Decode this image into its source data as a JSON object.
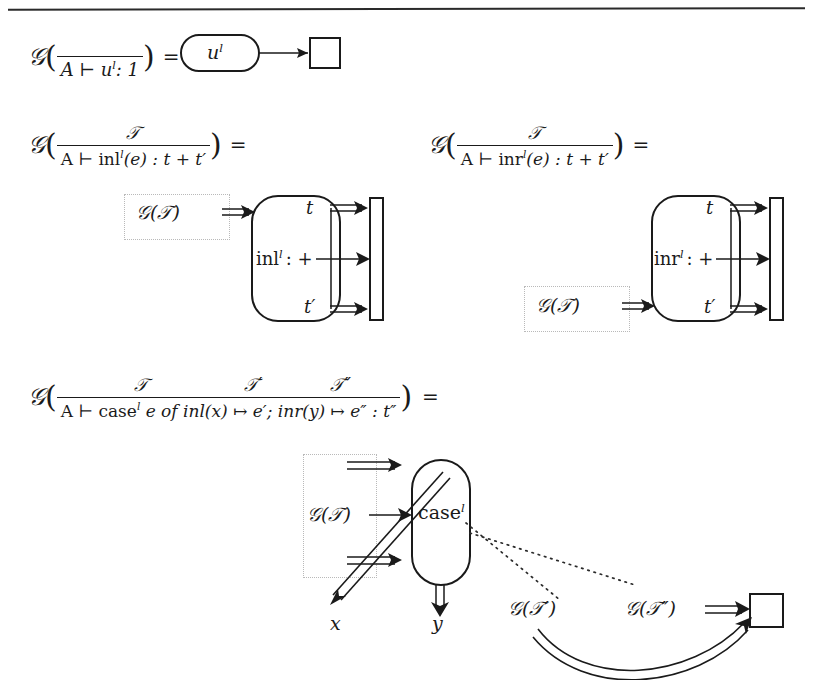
{
  "page": {
    "width": 813,
    "height": 680,
    "background": "#ffffff",
    "ink": "#1a1a1a",
    "ghost_border": "#b9b9b9",
    "has_top_rule": true
  },
  "equations": [
    {
      "id": "unit",
      "lhs": {
        "functor": "G",
        "open_paren": "(",
        "rule": {
          "numerator": "",
          "denominator_parts": [
            "A",
            "⊢",
            "u",
            "l",
            ":",
            "1"
          ],
          "denominator_text": "A ⊢ uˡ : 1"
        },
        "close_paren": ")"
      },
      "equals": "=",
      "diagram": {
        "node_label": "u",
        "node_superscript": "l",
        "node_shape": "stadium",
        "target_shape": "square",
        "arrow_style": "single"
      }
    },
    {
      "id": "inl",
      "lhs": {
        "functor": "G",
        "open_paren": "(",
        "rule": {
          "numerator": "T",
          "denominator_text": "A ⊢ inlˡ(e) : t + t′"
        },
        "close_paren": ")"
      },
      "equals": "=",
      "diagram": {
        "input_label": "G(T)",
        "input_position": "top",
        "box_label": "inl",
        "box_superscript": "l",
        "box_operator": ": +",
        "out_top": "t",
        "out_bottom": "t′",
        "bar": "tensor-bar",
        "arrows": [
          "double",
          "single",
          "double"
        ]
      }
    },
    {
      "id": "inr",
      "lhs": {
        "functor": "G",
        "open_paren": "(",
        "rule": {
          "numerator": "T",
          "denominator_text": "A ⊢ inrˡ(e) : t + t′"
        },
        "close_paren": ")"
      },
      "equals": "=",
      "diagram": {
        "input_label": "G(T)",
        "input_position": "bottom",
        "box_label": "inr",
        "box_superscript": "l",
        "box_operator": ": +",
        "out_top": "t",
        "out_bottom": "t′",
        "bar": "tensor-bar",
        "arrows": [
          "double",
          "single",
          "double"
        ]
      }
    },
    {
      "id": "case",
      "lhs": {
        "functor": "G",
        "open_paren": "(",
        "rule": {
          "numerators": [
            "T",
            "T′",
            "T″"
          ],
          "denominator_text": "A ⊢ caseˡ e of inl(x) ↦ e′; inr(y) ↦ e″ : t″"
        },
        "close_paren": ")"
      },
      "equals": "=",
      "diagram": {
        "input_label": "G(T)",
        "box_label": "case",
        "box_superscript": "l",
        "out_left": "x",
        "out_right": "y",
        "aux_labels": [
          "G(T′)",
          "G(T″)"
        ],
        "target_shape": "square",
        "dotted_connectors": 2,
        "curved_arrow": "double"
      }
    }
  ],
  "symbols": {
    "functor": "𝒢",
    "turnstile": "⊢",
    "mapsto": "↦",
    "plus": "+",
    "equals": "=",
    "colon": ":",
    "semicolon": ";",
    "prime": "′",
    "dprime": "″",
    "script_T": "𝒯",
    "of_keyword": "of",
    "one": "1"
  },
  "glyphs": {
    "eq1_rule_den": "A ⊢ u",
    "eq1_rule_tail": ": 1",
    "eq2_rule_den_head": "A ⊢ inl",
    "eq2_rule_den_tail": "(e) : t + t′",
    "eq3_rule_den_head": "A ⊢ inr",
    "eq3_rule_den_tail": "(e) : t + t′",
    "eq4_den_head": "A ⊢ case",
    "eq4_den_mid": "e of inl(x)  ↦  e′;  inr(y)  ↦  e″ : t″",
    "u_label": "u",
    "sup_l": "l",
    "inl_word": "inl",
    "inr_word": "inr",
    "case_word": "case",
    "op_plus": ": +",
    "t_label": "t",
    "tprime_label": "t′",
    "x_label": "x",
    "y_label": "y",
    "gT": "(𝒯)",
    "gTp": "(𝒯′)",
    "gTpp": "(𝒯″)",
    "numT": "𝒯",
    "numTp": "𝒯′",
    "numTpp": "𝒯″"
  }
}
